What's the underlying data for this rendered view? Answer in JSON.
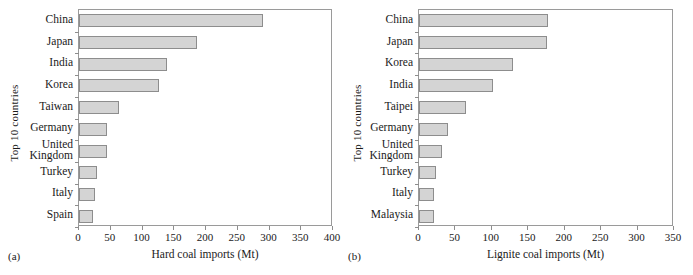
{
  "figure": {
    "width": 693,
    "height": 275,
    "bar_fill": "#d4d4d4",
    "bar_stroke": "#8d8d8d",
    "axis_color": "#9a9a9a"
  },
  "panels": [
    {
      "caption": "(a)",
      "ylabel": "Top 10 countries",
      "xlabel": "Hard coal imports (Mt)"
    },
    {
      "caption": "(b)",
      "ylabel": "Top 10 countries",
      "xlabel": "Lignite coal imports (Mt)"
    }
  ],
  "chart_data": [
    {
      "type": "bar",
      "orientation": "horizontal",
      "title": "",
      "xlabel": "Hard coal imports (Mt)",
      "ylabel": "Top 10 countries",
      "categories": [
        "China",
        "Japan",
        "India",
        "Korea",
        "Taiwan",
        "Germany",
        "United Kingdom",
        "Turkey",
        "Italy",
        "Spain"
      ],
      "values": [
        290,
        186,
        138,
        126,
        63,
        44,
        44,
        29,
        25,
        22
      ],
      "xlim": [
        0,
        400
      ],
      "xticks": [
        0,
        50,
        100,
        150,
        200,
        250,
        300,
        350,
        400
      ],
      "xticklabels": [
        "0",
        "50",
        "100",
        "150",
        "200",
        "250",
        "300",
        "350",
        "400"
      ],
      "grid": false,
      "legend": null
    },
    {
      "type": "bar",
      "orientation": "horizontal",
      "title": "",
      "xlabel": "Lignite coal imports (Mt)",
      "ylabel": "Top 10 countries",
      "categories": [
        "China",
        "Japan",
        "Korea",
        "India",
        "Taipei",
        "Germany",
        "United Kingdom",
        "Turkey",
        "Italy",
        "Malaysia"
      ],
      "values": [
        177,
        176,
        129,
        102,
        65,
        40,
        31,
        23,
        21,
        20
      ],
      "xlim": [
        0,
        350
      ],
      "xticks": [
        0,
        50,
        100,
        150,
        200,
        250,
        300,
        350
      ],
      "xticklabels": [
        "0",
        "50",
        "100",
        "150",
        "200",
        "250",
        "300",
        "350"
      ],
      "grid": false,
      "legend": null
    }
  ]
}
